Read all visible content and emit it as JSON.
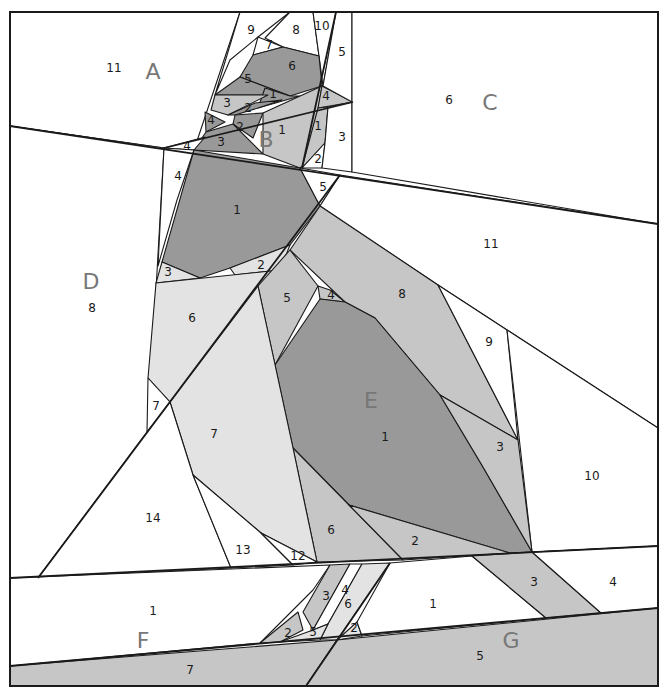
{
  "diagram": {
    "title": "Paper piecing pattern - bird on branch",
    "width": 665,
    "height": 690,
    "colors": {
      "white": "#ffffff",
      "light": "#e3e3e3",
      "mid": "#c6c6c6",
      "midDark": "#b3b3b3",
      "dark": "#999999",
      "line": "#1a1a1a",
      "sectionLabel": "#777777"
    },
    "frame": [
      10,
      12,
      658,
      686
    ],
    "sections": [
      {
        "id": "A",
        "label": "A",
        "x": 153,
        "y": 73
      },
      {
        "id": "B",
        "label": "B",
        "x": 266,
        "y": 141
      },
      {
        "id": "C",
        "label": "C",
        "x": 490,
        "y": 104
      },
      {
        "id": "D",
        "label": "D",
        "x": 91,
        "y": 283
      },
      {
        "id": "E",
        "label": "E",
        "x": 371,
        "y": 402
      },
      {
        "id": "F",
        "label": "F",
        "x": 143,
        "y": 642
      },
      {
        "id": "G",
        "label": "G",
        "x": 511,
        "y": 642
      }
    ],
    "pieces": [
      {
        "section": "A",
        "num": "11",
        "x": 114,
        "y": 68,
        "fill": "white",
        "pts": "10,12 240,12 194,150 164,148 10,126"
      },
      {
        "section": "A",
        "num": "9",
        "x": 251,
        "y": 30,
        "fill": "white",
        "pts": "240,12 290,12 258,37 230,60 215,95"
      },
      {
        "section": "A",
        "num": "8",
        "x": 296,
        "y": 30,
        "fill": "white",
        "pts": "290,12 313,12 319,56 283,47 265,38"
      },
      {
        "section": "A",
        "num": "7",
        "x": 269,
        "y": 45,
        "fill": "white",
        "pts": "258,37 283,47 253,55"
      },
      {
        "section": "A",
        "num": "10",
        "x": 322,
        "y": 26,
        "fill": "white",
        "pts": "313,12 336,12 323,86 319,56"
      },
      {
        "section": "A",
        "num": "6",
        "x": 292,
        "y": 66,
        "fill": "dark",
        "pts": "253,55 283,47 319,56 322,86 290,96 240,77"
      },
      {
        "section": "A",
        "num": "5",
        "x": 248,
        "y": 79,
        "fill": "dark",
        "pts": "240,77 290,96 268,95 215,95"
      },
      {
        "section": "A",
        "num": "1",
        "x": 273,
        "y": 94,
        "fill": "dark",
        "pts": "265,88 290,96 300,96 258,108"
      },
      {
        "section": "A",
        "num": "3",
        "x": 227,
        "y": 103,
        "fill": "mid",
        "pts": "215,95 268,95 228,115 211,110"
      },
      {
        "section": "A",
        "num": "2",
        "x": 248,
        "y": 108,
        "fill": "dark",
        "pts": "228,115 255,103 282,100 258,108 235,115"
      },
      {
        "section": "A",
        "num": "4",
        "x": 211,
        "y": 120,
        "fill": "dark",
        "pts": "205,112 225,122 206,132"
      },
      {
        "section": "A",
        "num": "2",
        "x": 240,
        "y": 127,
        "fill": "dark",
        "pts": "235,115 263,113 253,138 233,124"
      },
      {
        "section": "A",
        "num": "3",
        "x": 221,
        "y": 142,
        "fill": "dark",
        "pts": "206,132 233,124 263,154 194,150"
      },
      {
        "section": "A",
        "num": "4",
        "x": 187,
        "y": 146,
        "fill": "white",
        "pts": "164,148 205,137 194,150"
      },
      {
        "section": "B",
        "num": "1",
        "x": 282,
        "y": 130,
        "fill": "mid",
        "pts": "263,113 322,86 310,160 300,168 263,154"
      },
      {
        "section": "B",
        "num": "4",
        "x": 326,
        "y": 96,
        "fill": "mid",
        "pts": "322,86 353,102 318,108"
      },
      {
        "section": "B",
        "num": "1",
        "x": 318,
        "y": 126,
        "fill": "mid",
        "pts": "318,108 328,107 325,143 302,168"
      },
      {
        "section": "B",
        "num": "2",
        "x": 318,
        "y": 159,
        "fill": "white",
        "pts": "325,143 322,168 302,168"
      },
      {
        "section": "B",
        "num": "3",
        "x": 342,
        "y": 137,
        "fill": "white",
        "pts": "328,107 352,102 352,172 322,168 325,143"
      },
      {
        "section": "B",
        "num": "5",
        "x": 342,
        "y": 52,
        "fill": "white",
        "pts": "336,12 352,12 352,102 323,86"
      },
      {
        "section": "C",
        "num": "6",
        "x": 449,
        "y": 100,
        "fill": "white",
        "pts": "352,12 658,12 658,224 352,172"
      },
      {
        "section": "D",
        "num": "8",
        "x": 92,
        "y": 308,
        "fill": "white",
        "pts": "10,126 164,148 148,432 38,578 10,578"
      },
      {
        "section": "D",
        "num": "4",
        "x": 178,
        "y": 176,
        "fill": "white",
        "pts": "164,148 194,150 177,200 158,266"
      },
      {
        "section": "D",
        "num": "1",
        "x": 237,
        "y": 210,
        "fill": "dark",
        "pts": "194,150 300,168 320,206 290,245 230,268 200,278 162,262"
      },
      {
        "section": "D",
        "num": "5",
        "x": 323,
        "y": 187,
        "fill": "white",
        "pts": "300,168 340,175 320,206"
      },
      {
        "section": "D",
        "num": "3",
        "x": 168,
        "y": 272,
        "fill": "light",
        "pts": "162,262 200,278 156,283"
      },
      {
        "section": "D",
        "num": "2",
        "x": 261,
        "y": 265,
        "fill": "light",
        "pts": "230,268 290,245 280,270 235,275"
      },
      {
        "section": "D",
        "num": "6",
        "x": 192,
        "y": 318,
        "fill": "light",
        "pts": "156,283 280,270 170,402 148,378"
      },
      {
        "section": "D",
        "num": "7",
        "x": 156,
        "y": 406,
        "fill": "white",
        "pts": "148,378 170,402 160,416 147,432"
      },
      {
        "section": "E",
        "num": "11",
        "x": 491,
        "y": 244,
        "fill": "white",
        "pts": "340,175 658,224 658,428 438,285 320,206"
      },
      {
        "section": "E",
        "num": "8",
        "x": 402,
        "y": 294,
        "fill": "mid",
        "pts": "320,206 438,285 518,440 440,395 375,318 345,302 290,250"
      },
      {
        "section": "E",
        "num": "9",
        "x": 489,
        "y": 342,
        "fill": "white",
        "pts": "438,285 507,330 518,440"
      },
      {
        "section": "E",
        "num": "10",
        "x": 592,
        "y": 476,
        "fill": "white",
        "pts": "507,330 658,428 658,546 532,552"
      },
      {
        "section": "E",
        "num": "5",
        "x": 287,
        "y": 298,
        "fill": "mid",
        "pts": "290,250 318,286 275,365 258,286"
      },
      {
        "section": "E",
        "num": "4",
        "x": 331,
        "y": 295,
        "fill": "mid",
        "pts": "318,286 330,290 345,302 320,299"
      },
      {
        "section": "E",
        "num": "1",
        "x": 385,
        "y": 437,
        "fill": "dark",
        "pts": "320,299 345,302 375,318 440,395 483,467 532,552 510,553 349,505 293,448 275,365"
      },
      {
        "section": "E",
        "num": "3",
        "x": 500,
        "y": 447,
        "fill": "mid",
        "pts": "440,395 518,440 532,552 483,467"
      },
      {
        "section": "E",
        "num": "6",
        "x": 331,
        "y": 530,
        "fill": "mid",
        "pts": "293,448 349,505 403,560 317,562"
      },
      {
        "section": "E",
        "num": "2",
        "x": 415,
        "y": 541,
        "fill": "mid",
        "pts": "349,505 510,553 403,560"
      },
      {
        "section": "E",
        "num": "7",
        "x": 214,
        "y": 434,
        "fill": "light",
        "pts": "170,402 258,286 293,448 317,562 261,533 193,475"
      },
      {
        "section": "E",
        "num": "14",
        "x": 153,
        "y": 518,
        "fill": "white",
        "pts": "147,432 170,402 193,475 231,568 38,578"
      },
      {
        "section": "E",
        "num": "13",
        "x": 243,
        "y": 550,
        "fill": "white",
        "pts": "193,475 261,533 293,565 231,568"
      },
      {
        "section": "E",
        "num": "12",
        "x": 298,
        "y": 556,
        "fill": "white",
        "pts": "261,533 317,562 293,565"
      },
      {
        "section": "F",
        "num": "1",
        "x": 153,
        "y": 611,
        "fill": "white",
        "pts": "10,578 330,565 313,590 298,605 260,643 10,666"
      },
      {
        "section": "F",
        "num": "3",
        "x": 326,
        "y": 596,
        "fill": "mid",
        "pts": "330,565 350,564 313,630 303,612"
      },
      {
        "section": "F",
        "num": "4",
        "x": 345,
        "y": 590,
        "fill": "white",
        "pts": "350,564 362,564 328,624 313,630"
      },
      {
        "section": "F",
        "num": "6",
        "x": 348,
        "y": 604,
        "fill": "light",
        "pts": "362,564 390,563 337,640 320,640 328,624"
      },
      {
        "section": "F",
        "num": "2",
        "x": 288,
        "y": 633,
        "fill": "mid",
        "pts": "260,643 298,612 303,630 280,642"
      },
      {
        "section": "F",
        "num": "5",
        "x": 313,
        "y": 632,
        "fill": "light",
        "pts": "280,642 313,630 328,624 320,640"
      },
      {
        "section": "F",
        "num": "7",
        "x": 190,
        "y": 670,
        "fill": "mid",
        "pts": "10,666 337,640 306,686 10,686"
      },
      {
        "section": "G",
        "num": "2",
        "x": 354,
        "y": 628,
        "fill": "light",
        "pts": "357,622 362,636 337,640"
      },
      {
        "section": "G",
        "num": "1",
        "x": 433,
        "y": 604,
        "fill": "white",
        "pts": "390,563 472,556 546,618 362,636 357,622"
      },
      {
        "section": "G",
        "num": "3",
        "x": 534,
        "y": 582,
        "fill": "mid",
        "pts": "472,556 532,552 601,613 546,618"
      },
      {
        "section": "G",
        "num": "4",
        "x": 613,
        "y": 582,
        "fill": "white",
        "pts": "532,552 658,546 658,608 601,613"
      },
      {
        "section": "G",
        "num": "5",
        "x": 480,
        "y": 656,
        "fill": "mid",
        "pts": "337,640 658,608 658,686 306,686"
      }
    ],
    "seams": [
      "10,126 658,224",
      "38,578 340,175",
      "306,686 390,563",
      "10,578 658,546",
      "10,666 658,608",
      "336,12 302,168",
      "164,148 353,102"
    ]
  }
}
